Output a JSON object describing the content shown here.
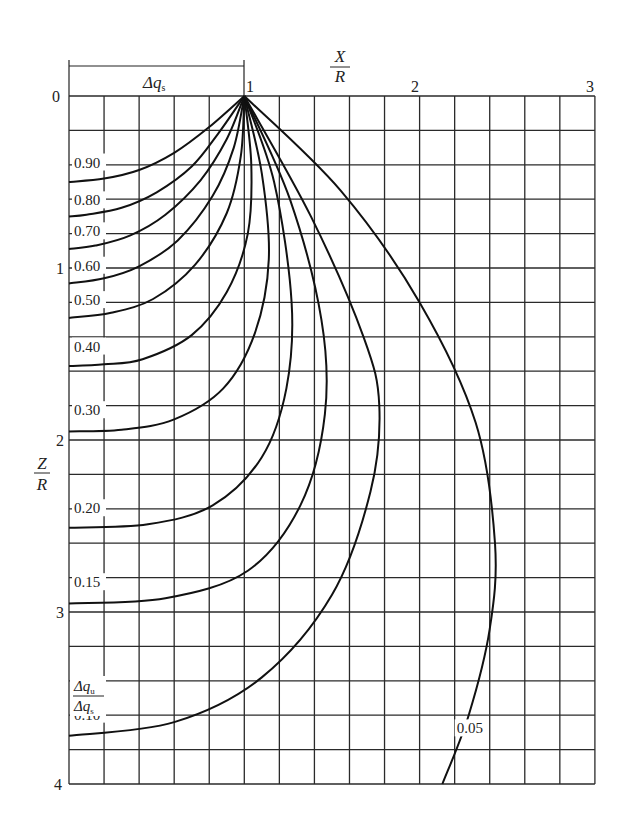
{
  "chart_data": {
    "type": "line",
    "title": "",
    "xlabel": "X/R",
    "ylabel": "Z/R",
    "xlim": [
      0,
      3
    ],
    "ylim": [
      0,
      4
    ],
    "y_inverted": true,
    "grid": true,
    "grid_step": {
      "x": 0.2,
      "y": 0.2
    },
    "x_ticks": [
      "1",
      "2",
      "3"
    ],
    "y_ticks": [
      "0",
      "1",
      "2",
      "3",
      "4"
    ],
    "dimension_label": "Δq_s",
    "dimension_span": [
      0,
      1
    ],
    "curve_family_label": "Δq_u / Δq_s",
    "apex": {
      "x": 1.0,
      "z": 0.0
    },
    "series": [
      {
        "name": "0.90",
        "label_pos": [
          0.0,
          0.41
        ],
        "points": [
          [
            1.0,
            0.0
          ],
          [
            0.8,
            0.18
          ],
          [
            0.6,
            0.33
          ],
          [
            0.4,
            0.43
          ],
          [
            0.2,
            0.48
          ],
          [
            0.0,
            0.5
          ]
        ]
      },
      {
        "name": "0.80",
        "label_pos": [
          0.0,
          0.63
        ],
        "points": [
          [
            1.0,
            0.0
          ],
          [
            0.85,
            0.22
          ],
          [
            0.7,
            0.41
          ],
          [
            0.5,
            0.56
          ],
          [
            0.3,
            0.65
          ],
          [
            0.1,
            0.69
          ],
          [
            0.0,
            0.7
          ]
        ]
      },
      {
        "name": "0.70",
        "label_pos": [
          0.0,
          0.81
        ],
        "points": [
          [
            1.0,
            0.0
          ],
          [
            0.9,
            0.25
          ],
          [
            0.75,
            0.49
          ],
          [
            0.55,
            0.69
          ],
          [
            0.35,
            0.81
          ],
          [
            0.15,
            0.87
          ],
          [
            0.0,
            0.89
          ]
        ]
      },
      {
        "name": "0.60",
        "label_pos": [
          0.0,
          1.01
        ],
        "points": [
          [
            1.0,
            0.0
          ],
          [
            0.94,
            0.3
          ],
          [
            0.82,
            0.58
          ],
          [
            0.62,
            0.84
          ],
          [
            0.4,
            0.99
          ],
          [
            0.2,
            1.06
          ],
          [
            0.0,
            1.09
          ]
        ]
      },
      {
        "name": "0.50",
        "label_pos": [
          0.0,
          1.21
        ],
        "points": [
          [
            1.0,
            0.0
          ],
          [
            0.98,
            0.35
          ],
          [
            0.9,
            0.68
          ],
          [
            0.72,
            0.98
          ],
          [
            0.48,
            1.18
          ],
          [
            0.24,
            1.26
          ],
          [
            0.0,
            1.29
          ]
        ]
      },
      {
        "name": "0.40",
        "label_pos": [
          0.0,
          1.48
        ],
        "points": [
          [
            1.0,
            0.0
          ],
          [
            1.04,
            0.4
          ],
          [
            1.02,
            0.8
          ],
          [
            0.9,
            1.14
          ],
          [
            0.7,
            1.39
          ],
          [
            0.42,
            1.53
          ],
          [
            0.2,
            1.56
          ],
          [
            0.0,
            1.57
          ]
        ]
      },
      {
        "name": "0.30",
        "label_pos": [
          0.0,
          1.85
        ],
        "points": [
          [
            1.0,
            0.0
          ],
          [
            1.1,
            0.45
          ],
          [
            1.14,
            0.95
          ],
          [
            1.06,
            1.38
          ],
          [
            0.88,
            1.7
          ],
          [
            0.6,
            1.88
          ],
          [
            0.3,
            1.94
          ],
          [
            0.0,
            1.95
          ]
        ]
      },
      {
        "name": "0.20",
        "label_pos": [
          0.0,
          2.42
        ],
        "points": [
          [
            1.0,
            0.0
          ],
          [
            1.17,
            0.5
          ],
          [
            1.27,
            1.2
          ],
          [
            1.24,
            1.7
          ],
          [
            1.1,
            2.1
          ],
          [
            0.82,
            2.38
          ],
          [
            0.45,
            2.49
          ],
          [
            0.0,
            2.51
          ]
        ]
      },
      {
        "name": "0.15",
        "label_pos": [
          0.0,
          2.85
        ],
        "points": [
          [
            1.0,
            0.0
          ],
          [
            1.26,
            0.6
          ],
          [
            1.44,
            1.3
          ],
          [
            1.46,
            1.85
          ],
          [
            1.32,
            2.38
          ],
          [
            1.02,
            2.76
          ],
          [
            0.55,
            2.92
          ],
          [
            0.0,
            2.95
          ]
        ]
      },
      {
        "name": "0.10",
        "label_pos": [
          0.0,
          3.62
        ],
        "points": [
          [
            1.0,
            0.0
          ],
          [
            1.38,
            0.7
          ],
          [
            1.68,
            1.4
          ],
          [
            1.77,
            1.8
          ],
          [
            1.72,
            2.3
          ],
          [
            1.5,
            2.9
          ],
          [
            1.1,
            3.38
          ],
          [
            0.6,
            3.64
          ],
          [
            0.0,
            3.72
          ]
        ]
      },
      {
        "name": "0.05",
        "label_pos": [
          2.2,
          3.7
        ],
        "points": [
          [
            1.0,
            0.0
          ],
          [
            1.55,
            0.55
          ],
          [
            2.0,
            1.2
          ],
          [
            2.32,
            1.9
          ],
          [
            2.43,
            2.6
          ],
          [
            2.4,
            3.1
          ],
          [
            2.28,
            3.6
          ],
          [
            2.13,
            4.0
          ]
        ]
      }
    ]
  },
  "labels": {
    "x_axis_num": "X",
    "x_axis_den": "R",
    "z_axis_num": "Z",
    "z_axis_den": "R",
    "delta_qs": "Δq",
    "delta_qs_sub": "s",
    "ratio_num": "Δq",
    "ratio_num_sub": "u",
    "ratio_den": "Δq",
    "ratio_den_sub": "s",
    "tick_x_1": "1",
    "tick_x_2": "2",
    "tick_x_3": "3",
    "tick_z_0": "0",
    "tick_z_1": "1",
    "tick_z_2": "2",
    "tick_z_3": "3",
    "tick_z_4": "4"
  }
}
